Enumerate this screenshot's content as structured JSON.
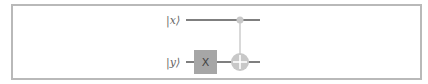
{
  "diagram": {
    "type": "quantum-circuit",
    "qubits": [
      {
        "id": "x",
        "label": "|x⟩"
      },
      {
        "id": "y",
        "label": "|y⟩"
      }
    ],
    "gates": [
      {
        "type": "X",
        "label": "X",
        "qubit": "y"
      },
      {
        "type": "CNOT",
        "control": "x",
        "target": "y"
      }
    ],
    "colors": {
      "wire": "#555555",
      "gate_fill": "#a6a6a6",
      "control": "#c8c8c8",
      "frame": "#b9b9b9"
    }
  }
}
